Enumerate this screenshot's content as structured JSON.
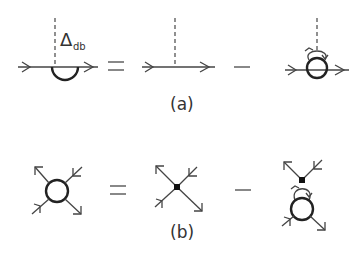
{
  "diagram": {
    "panels": [
      {
        "id": "a",
        "label": "(a)",
        "equation": {
          "lhs": {
            "description": "propagator line with self-energy semicircle bubble below and dashed vertex",
            "vertex_label": "Δ",
            "vertex_subscript": "db"
          },
          "operators": [
            "=",
            "−"
          ],
          "terms": [
            "straight propagator with dashed vertical line",
            "propagator with circle bubble, loop arc above and dashed vertical line"
          ]
        }
      },
      {
        "id": "b",
        "label": "(b)",
        "equation": {
          "lhs": {
            "description": "open circle vertex with four external arrowed legs"
          },
          "operators": [
            "=",
            "−"
          ],
          "terms": [
            "filled dot vertex with four arrowed legs",
            "filled dot vertex with two upper legs connected by loop to circle with two lower legs"
          ]
        }
      }
    ],
    "symbols": {
      "equals": "=",
      "minus": "−",
      "delta": "Δ",
      "delta_sub": "db"
    },
    "colors": {
      "line": "#444444",
      "bold": "#222222",
      "background": "#ffffff"
    }
  }
}
